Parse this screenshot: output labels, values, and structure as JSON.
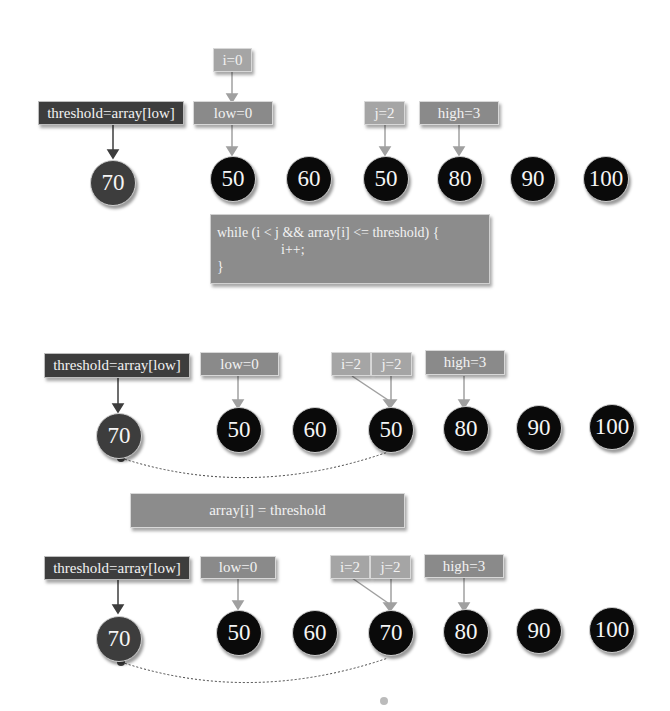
{
  "colors": {
    "pivot_node": "#3d3d3d",
    "node": "#0a0a0a",
    "threshold_box": "#3d3d3d",
    "pointer_box": "#8a8a8a",
    "index_box": "#a5a5a5",
    "code_box": "#8c8c8c"
  },
  "step1": {
    "threshold_label": "threshold=array[low]",
    "pivot": "70",
    "i_label": "i=0",
    "low_label": "low=0",
    "j_label": "j=2",
    "high_label": "high=3",
    "nodes": [
      "50",
      "60",
      "50",
      "80",
      "90",
      "100"
    ],
    "code": [
      "while (i < j && array[i] <= threshold) {",
      "i++;",
      "}"
    ]
  },
  "step2": {
    "threshold_label": "threshold=array[low]",
    "pivot": "70",
    "low_label": "low=0",
    "i_label": "i=2",
    "j_label": "j=2",
    "high_label": "high=3",
    "nodes": [
      "50",
      "60",
      "50",
      "80",
      "90",
      "100"
    ]
  },
  "assign_label": "array[i] = threshold",
  "step3": {
    "threshold_label": "threshold=array[low]",
    "pivot": "70",
    "low_label": "low=0",
    "i_label": "i=2",
    "j_label": "j=2",
    "high_label": "high=3",
    "nodes": [
      "50",
      "60",
      "70",
      "80",
      "90",
      "100"
    ]
  }
}
